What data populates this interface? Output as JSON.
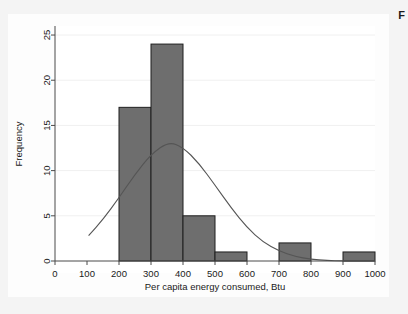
{
  "figure": {
    "caption_fragment": "F",
    "background_color": "#f4f4f4",
    "plot_background_color": "#ffffff",
    "bar_color": "#6e6e6e",
    "bar_edge_color": "#1f1f1f",
    "curve_color": "#555555",
    "axis_color": "#4a4a4a",
    "gridline_color": "#f0f0f0"
  },
  "chart_data": {
    "type": "bar",
    "title": "",
    "subtitle": "",
    "xlabel": "Per capita energy consumed, Btu",
    "ylabel": "Frequency",
    "xlim": [
      0,
      1000
    ],
    "ylim": [
      0,
      26
    ],
    "xticks": [
      0,
      100,
      200,
      300,
      400,
      500,
      600,
      700,
      800,
      900,
      1000
    ],
    "xtick_labels": [
      "0",
      "100",
      "200",
      "300",
      "400",
      "500",
      "600",
      "700",
      "800",
      "900",
      "1000"
    ],
    "yticks": [
      0,
      5,
      10,
      15,
      20,
      25
    ],
    "ytick_labels": [
      "0",
      "5",
      "10",
      "15",
      "20",
      "25"
    ],
    "grid": "horizontal",
    "legend": "none",
    "bin_width": 100,
    "bins": [
      {
        "x_start": 200,
        "x_end": 300,
        "frequency": 17
      },
      {
        "x_start": 300,
        "x_end": 400,
        "frequency": 24
      },
      {
        "x_start": 400,
        "x_end": 500,
        "frequency": 5
      },
      {
        "x_start": 500,
        "x_end": 600,
        "frequency": 1
      },
      {
        "x_start": 700,
        "x_end": 800,
        "frequency": 2
      },
      {
        "x_start": 900,
        "x_end": 1000,
        "frequency": 1
      }
    ],
    "categories": [
      "200-300",
      "300-400",
      "400-500",
      "500-600",
      "600-700",
      "700-800",
      "800-900",
      "900-1000"
    ],
    "values": [
      17,
      24,
      5,
      1,
      0,
      2,
      0,
      1
    ],
    "overlay_curve": {
      "name": "normal density overlay",
      "kind": "line",
      "peak_x": 355,
      "peak_y": 13.2,
      "mean": 355,
      "sigma": 128,
      "amplitude": 13.2,
      "x_start": 105,
      "x_end": 1000,
      "points": [
        {
          "x": 105,
          "y": 2.8
        },
        {
          "x": 150,
          "y": 4.6
        },
        {
          "x": 200,
          "y": 7.0
        },
        {
          "x": 250,
          "y": 9.6
        },
        {
          "x": 300,
          "y": 11.8
        },
        {
          "x": 355,
          "y": 13.2
        },
        {
          "x": 400,
          "y": 12.6
        },
        {
          "x": 450,
          "y": 10.8
        },
        {
          "x": 500,
          "y": 8.4
        },
        {
          "x": 550,
          "y": 5.9
        },
        {
          "x": 600,
          "y": 3.7
        },
        {
          "x": 650,
          "y": 2.1
        },
        {
          "x": 700,
          "y": 1.1
        },
        {
          "x": 750,
          "y": 0.5
        },
        {
          "x": 800,
          "y": 0.2
        },
        {
          "x": 850,
          "y": 0.05
        },
        {
          "x": 900,
          "y": 0.02
        },
        {
          "x": 1000,
          "y": 0.0
        }
      ]
    }
  }
}
